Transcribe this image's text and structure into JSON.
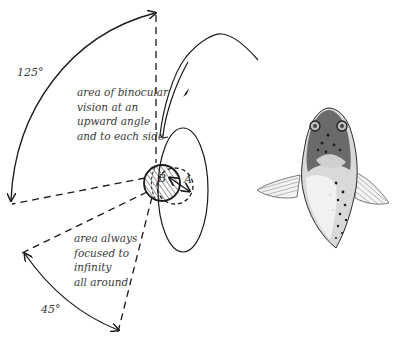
{
  "diagram": {
    "angles": {
      "upper": "125°",
      "lower": "45°"
    },
    "regions": {
      "binocular": {
        "lines": [
          "area of binocular",
          "vision at an",
          "upward angle",
          "and to each side"
        ]
      },
      "infinity": {
        "lines": [
          "area always",
          "focused to",
          "infinity",
          "all around"
        ]
      }
    },
    "eye_labels": {
      "a": "A",
      "b": "B"
    },
    "colors": {
      "ink": "#1a1a1a",
      "text": "#3a3a3a",
      "background": "#ffffff"
    }
  }
}
